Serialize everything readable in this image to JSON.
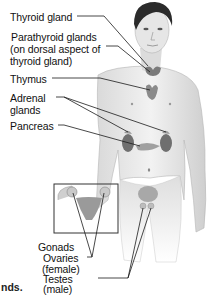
{
  "figure": {
    "labels": {
      "thyroid": "Thyroid gland",
      "parathyroid_1": "Parathyroid glands",
      "parathyroid_2": "(on dorsal aspect of",
      "parathyroid_3": "thyroid gland)",
      "thymus": "Thymus",
      "adrenal_1": "Adrenal",
      "adrenal_2": "glands",
      "pancreas": "Pancreas",
      "gonads": "Gonads",
      "ovaries": "Ovaries",
      "ovaries_sub": "(female)",
      "testes": "Testes",
      "testes_sub": "(male)"
    },
    "caption_fragment": "nds.",
    "colors": {
      "skin_light": "#ececec",
      "skin_mid": "#cfcfcf",
      "skin_dark": "#9a9a9a",
      "hair": "#2b2b2b",
      "organ": "#777777",
      "leader_line": "#1a1a1a"
    }
  }
}
